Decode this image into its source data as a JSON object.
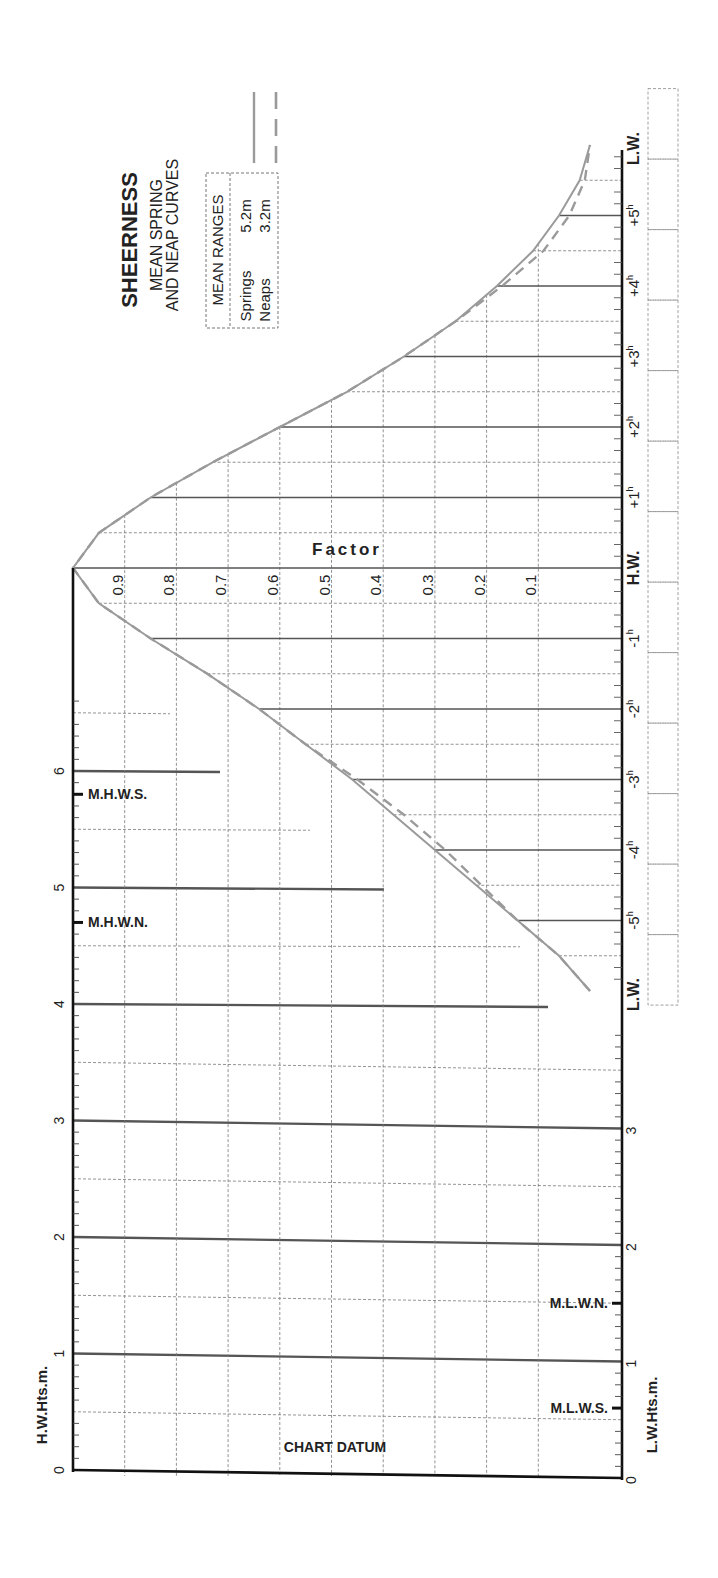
{
  "title": "SHEERNESS",
  "subtitle_line1": "MEAN SPRING",
  "subtitle_line2": "AND NEAP CURVES",
  "ranges_box": {
    "header": "MEAN RANGES",
    "springs_label": "Springs",
    "springs_value": "5.2m",
    "neaps_label": "Neaps",
    "neaps_value": "3.2m"
  },
  "factor_label": "Factor",
  "factor_ticks": [
    "0.9",
    "0.8",
    "0.7",
    "0.6",
    "0.5",
    "0.4",
    "0.3",
    "0.2",
    "0.1"
  ],
  "time_labels": {
    "lw_before": "L.W.",
    "minus5": "-5",
    "minus4": "-4",
    "minus3": "-3",
    "minus2": "-2",
    "minus1": "-1",
    "hw": "H.W.",
    "plus1": "+1",
    "plus2": "+2",
    "plus3": "+3",
    "plus4": "+4",
    "plus5": "+5",
    "lw_after": "L.W.",
    "hour_suffix": "h"
  },
  "hw_axis": {
    "label": "H.W.Hts.m.",
    "ticks": [
      "0",
      "1",
      "2",
      "3",
      "4",
      "5",
      "6"
    ],
    "markers": {
      "mhws": "M.H.W.S.",
      "mhwn": "M.H.W.N."
    }
  },
  "lw_axis": {
    "label": "L.W.Hts.m.",
    "ticks": [
      "0",
      "1",
      "2",
      "3"
    ],
    "markers": {
      "mlwn": "M.L.W.N.",
      "mlws": "M.L.W.S."
    }
  },
  "datum_label": "CHART DATUM",
  "colors": {
    "curve": "#9a9a9a",
    "axis": "#111111",
    "grid": "#777777",
    "heavy_grid": "#555555"
  },
  "chart_data": {
    "type": "line",
    "xlabel": "Time relative to H.W. (hours)",
    "ylabel": "Factor",
    "x": [
      -6,
      -5.5,
      -5,
      -4.5,
      -4,
      -3.5,
      -3,
      -2.5,
      -2,
      -1.5,
      -1,
      -0.5,
      0,
      0.5,
      1,
      1.5,
      2,
      2.5,
      3,
      3.5,
      4,
      4.5,
      5,
      5.5,
      6
    ],
    "series": [
      {
        "name": "Springs",
        "style": "solid",
        "values": [
          0.0,
          0.06,
          0.14,
          0.22,
          0.3,
          0.38,
          0.46,
          0.55,
          0.64,
          0.74,
          0.85,
          0.95,
          1.0,
          0.95,
          0.85,
          0.73,
          0.6,
          0.47,
          0.36,
          0.26,
          0.18,
          0.11,
          0.06,
          0.02,
          0.0
        ]
      },
      {
        "name": "Neaps",
        "style": "dashed",
        "values": [
          0.0,
          0.06,
          0.14,
          0.21,
          0.28,
          0.36,
          0.45,
          0.55,
          0.64,
          0.74,
          0.85,
          0.95,
          1.0,
          0.95,
          0.85,
          0.73,
          0.6,
          0.47,
          0.36,
          0.26,
          0.17,
          0.09,
          0.04,
          0.01,
          0.0
        ]
      }
    ],
    "ylim": [
      0,
      1
    ],
    "mean_ranges": {
      "springs_m": 5.2,
      "neaps_m": 3.2
    },
    "hw_height_axis_m": [
      0,
      6
    ],
    "lw_height_axis_m": [
      0,
      3
    ],
    "levels_m": {
      "MHWS": 5.8,
      "MHWN": 4.7,
      "MLWN": 1.5,
      "MLWS": 0.6
    }
  }
}
